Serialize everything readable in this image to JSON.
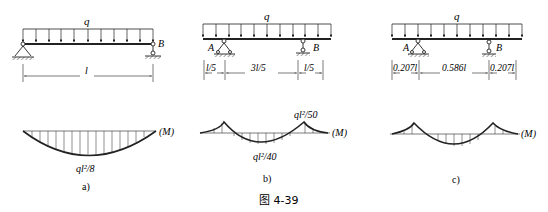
{
  "figure": {
    "caption": "图 4-39",
    "ink_color": "#222222"
  },
  "panels": [
    {
      "id": "a",
      "sublabel": "a)",
      "load_label": "q",
      "support_left_label": "",
      "support_right_label": "B",
      "dimensions": [
        "l"
      ],
      "moment_axis_label": "(M)",
      "moment_values": {
        "midspan": "ql²/8"
      }
    },
    {
      "id": "b",
      "sublabel": "b)",
      "load_label": "q",
      "support_left_label": "A",
      "support_right_label": "B",
      "dimensions": [
        "l/5",
        "3l/5",
        "l/5"
      ],
      "moment_axis_label": "(M)",
      "moment_values": {
        "support": "ql²/50",
        "midspan": "ql²/40"
      }
    },
    {
      "id": "c",
      "sublabel": "c)",
      "load_label": "q",
      "support_left_label": "A",
      "support_right_label": "B",
      "dimensions": [
        "0.207l",
        "0.586l",
        "0.207l"
      ],
      "moment_axis_label": "(M)",
      "moment_values": {}
    }
  ]
}
